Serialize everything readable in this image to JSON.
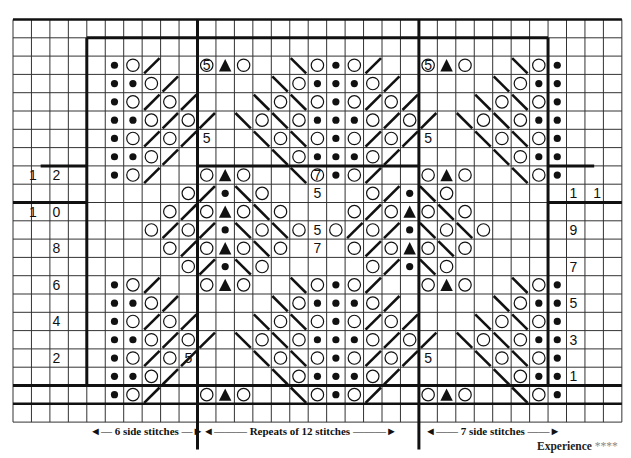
{
  "chart": {
    "grid": {
      "cols": 33,
      "rows": 21,
      "left": 13,
      "top": 19.5,
      "cell_w": 18.45,
      "cell_h": 18.3
    },
    "colors": {
      "ink": "#111111",
      "grid": "#333333",
      "background": "#ffffff"
    },
    "legend_symbols": {
      "k2tog_right": "/",
      "ssk_left": "\\",
      "yo": "O",
      "purl": "•",
      "sk2p": "▲"
    },
    "labels": {
      "left_side": "6 side stitches",
      "repeat": "Repeats of 12 stitches",
      "right_side": "7 side stitches",
      "experience": "Experience",
      "experience_stars": "****"
    },
    "row_numbers_left": [
      {
        "text": "1 2",
        "row": 8
      },
      {
        "text": "1 0",
        "row": 10
      },
      {
        "text": "8",
        "row": 12
      },
      {
        "text": "6",
        "row": 14
      },
      {
        "text": "4",
        "row": 16
      },
      {
        "text": "2",
        "row": 18
      }
    ],
    "row_numbers_right": [
      {
        "text": "1 1",
        "row": 9
      },
      {
        "text": "9",
        "row": 11
      },
      {
        "text": "7",
        "row": 13
      },
      {
        "text": "5",
        "row": 15
      },
      {
        "text": "3",
        "row": 17
      },
      {
        "text": "1",
        "row": 19
      }
    ],
    "inline_numbers": [
      {
        "text": "5",
        "row": 2,
        "col": 10
      },
      {
        "text": "5",
        "row": 6,
        "col": 10
      },
      {
        "text": "5",
        "row": 2,
        "col": 22
      },
      {
        "text": "5",
        "row": 6,
        "col": 22
      },
      {
        "text": "7",
        "row": 8,
        "col": 16
      },
      {
        "text": "5",
        "row": 9,
        "col": 16
      },
      {
        "text": "5",
        "row": 11,
        "col": 16
      },
      {
        "text": "7",
        "row": 12,
        "col": 16
      },
      {
        "text": "5",
        "row": 18,
        "col": 9
      },
      {
        "text": "5",
        "row": 18,
        "col": 22
      }
    ],
    "cells": [
      "                                 ",
      "     •O/  O▲O  \\O•O/  O▲O  \\O•    ",
      "     ••O/  5  \\O•••O/  5  \\O••    ",
      "     •O/O/   \\O\\O•O/O/   \\O\\O•    ",
      "     ••O/O/ \\O\\O•••O/O/ \\O\\O••    ",
      "     •O/O/   \\O\\O•O/O/   \\O\\O•    ",
      "     ••O/  5  \\O•••O/  5  \\O••    ",
      "     •O/  O▲O  \\O•O/  O▲O  \\O•    ",
      "         O/•\\O     O/•\\O         ",
      "        O/O▲O\\O   O/O▲O\\O        ",
      "       O/O/•\\O\\O O/O/•\\O\\O       ",
      "        O/O▲O\\O   O/O▲O\\O        ",
      "         O/•\\O     O/•\\O         ",
      "     •O/  O▲O  \\O•O/  O▲O  \\O•    ",
      "     ••O/     \\O•••O/     \\O••    ",
      "     •O/O/   \\O\\O•O/O/   \\O\\O•    ",
      "     ••O/O/ \\O\\O•••O/O/ \\O\\O••    ",
      "     •O/O/   \\O\\O•O/O/   \\O\\O•    ",
      "     ••O/     \\O•••O/     \\O••    ",
      "     •O/  O▲O  \\O•O/  O▲O  \\O•    ",
      "                                 "
    ]
  }
}
